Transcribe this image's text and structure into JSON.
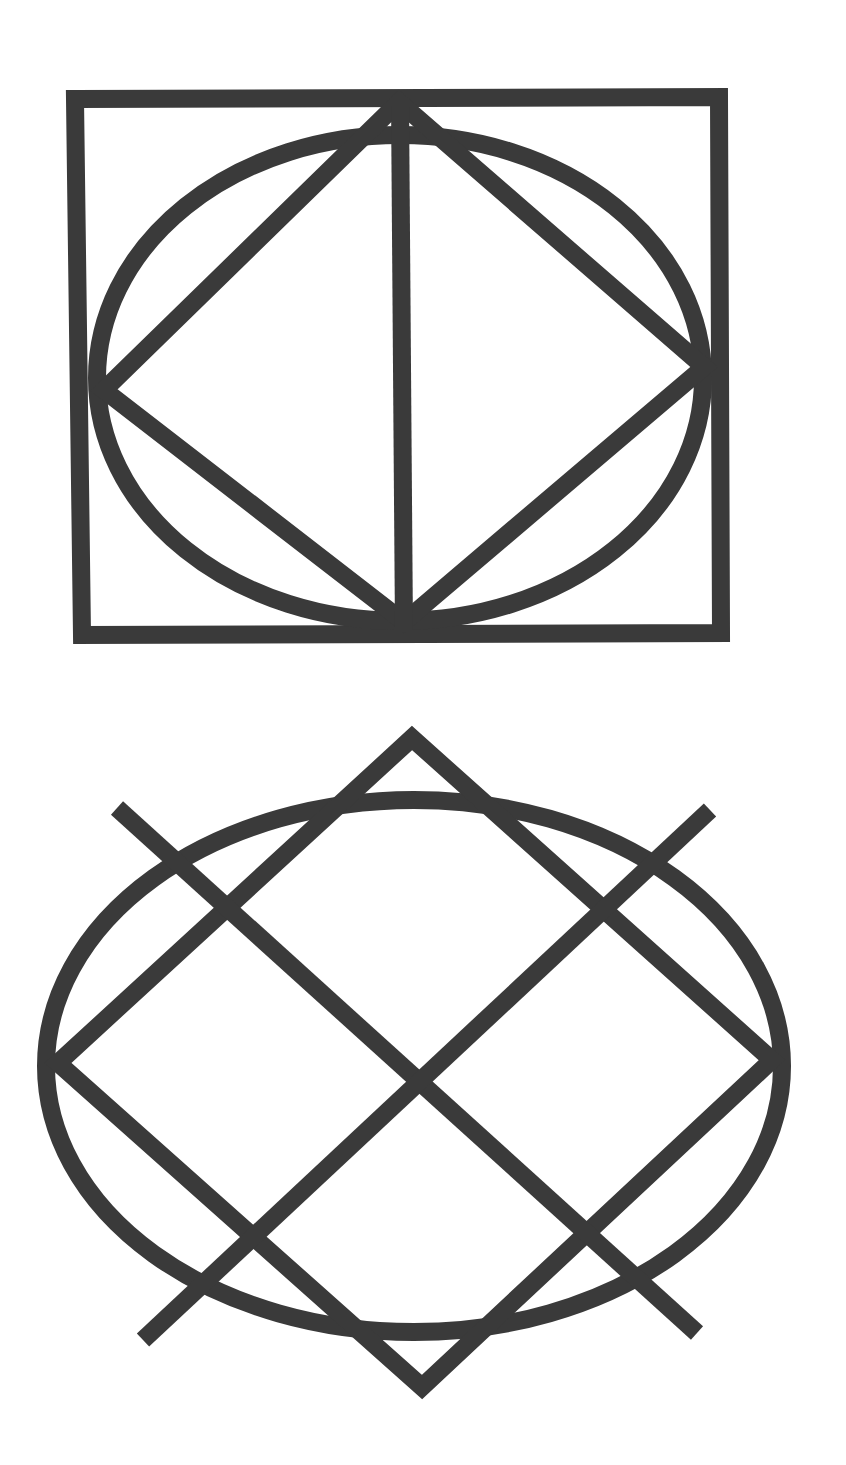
{
  "diagram": {
    "stroke_color": "#3a3a3a",
    "stroke_width": 18,
    "background": "#ffffff",
    "figures": [
      {
        "name": "figure-1-framed-ellipse",
        "rectangle": {
          "points": [
            [
              75,
              99
            ],
            [
              719,
              97
            ],
            [
              721,
              633
            ],
            [
              82,
              635
            ]
          ]
        },
        "ellipse": {
          "cx": 400,
          "cy": 378,
          "rx": 303,
          "ry": 243
        },
        "diamond": {
          "points": [
            [
              399,
              102
            ],
            [
              704,
              367
            ],
            [
              404,
              622
            ],
            [
              104,
              390
            ]
          ]
        },
        "vertical_line": {
          "x1": 400,
          "y1": 102,
          "x2": 404,
          "y2": 632
        }
      },
      {
        "name": "figure-2-ellipse-with-crossing-lines",
        "ellipse": {
          "cx": 414,
          "cy": 1066,
          "rx": 368,
          "ry": 266
        },
        "diamond": {
          "points": [
            [
              412,
              738
            ],
            [
              772,
              1060
            ],
            [
              422,
              1387
            ],
            [
              58,
              1063
            ]
          ]
        },
        "extended_lines": [
          {
            "x1": 117,
            "y1": 808,
            "x2": 697,
            "y2": 1333
          },
          {
            "x1": 710,
            "y1": 810,
            "x2": 143,
            "y2": 1340
          }
        ]
      }
    ]
  }
}
